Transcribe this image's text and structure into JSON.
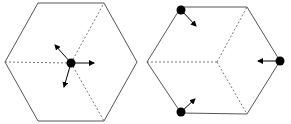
{
  "diagram": {
    "colors": {
      "edge": "#555555",
      "dashed": "#555555",
      "particle": "#000000",
      "background": "#ffffff"
    },
    "left_hexagon": {
      "vertices": [
        [
          38,
          3
        ],
        [
          104,
          3
        ],
        [
          137,
          62
        ],
        [
          104,
          121
        ],
        [
          38,
          121
        ],
        [
          5,
          62
        ]
      ],
      "center": [
        71,
        63
      ],
      "dashed_to": [
        [
          104,
          3
        ],
        [
          5,
          62
        ],
        [
          104,
          121
        ]
      ],
      "particle": [
        71,
        63
      ],
      "arrows": [
        {
          "from": [
            71,
            63
          ],
          "to": [
            94,
            63
          ]
        },
        {
          "from": [
            71,
            63
          ],
          "to": [
            55,
            45
          ]
        },
        {
          "from": [
            71,
            63
          ],
          "to": [
            64,
            87
          ]
        }
      ]
    },
    "right_hexagon": {
      "vertices": [
        [
          181,
          7
        ],
        [
          247,
          7
        ],
        [
          280,
          61
        ],
        [
          247,
          114
        ],
        [
          181,
          113
        ],
        [
          147,
          62
        ]
      ],
      "center": [
        217,
        62
      ],
      "dashed_to": [
        [
          247,
          7
        ],
        [
          147,
          62
        ],
        [
          247,
          114
        ]
      ],
      "particles": [
        [
          181,
          10
        ],
        [
          280,
          61
        ],
        [
          181,
          112
        ]
      ],
      "arrows": [
        {
          "from": [
            181,
            10
          ],
          "to": [
            196,
            26
          ]
        },
        {
          "from": [
            280,
            61
          ],
          "to": [
            258,
            61
          ]
        },
        {
          "from": [
            181,
            112
          ],
          "to": [
            195,
            99
          ]
        }
      ]
    }
  }
}
